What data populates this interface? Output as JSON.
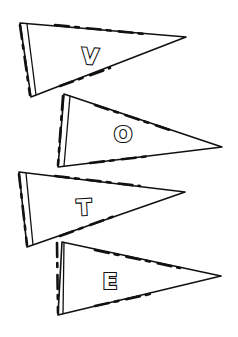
{
  "illustration": {
    "title": "VOTE pennants",
    "pennants": [
      {
        "letter": "V"
      },
      {
        "letter": "O"
      },
      {
        "letter": "T"
      },
      {
        "letter": "E"
      }
    ],
    "colors": {
      "ink": "#111111",
      "paper": "#ffffff"
    }
  }
}
